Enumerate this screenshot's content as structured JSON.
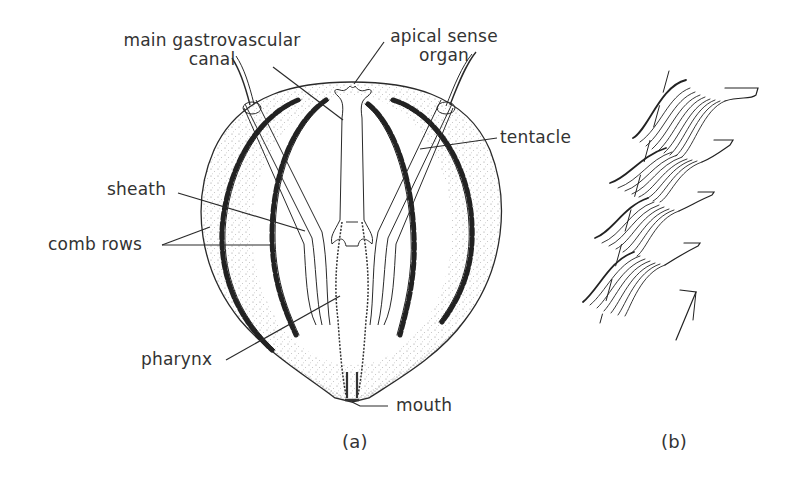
{
  "figure": {
    "panel_a": {
      "caption": "(a)",
      "labels": {
        "main_gastrovascular_canal_line1": "main gastrovascular",
        "main_gastrovascular_canal_line2": "canal",
        "apical_sense_organ_line1": "apical sense",
        "apical_sense_organ_line2": "organ",
        "tentacle": "tentacle",
        "sheath": "sheath",
        "comb_rows": "comb rows",
        "pharynx": "pharynx",
        "mouth": "mouth"
      }
    },
    "panel_b": {
      "caption": "(b)",
      "description": "detail of comb plates (ctenes) stacked along a comb row",
      "comb_plate_count": 4
    },
    "colors": {
      "ink": "#2a2a2a",
      "background": "#ffffff"
    }
  }
}
